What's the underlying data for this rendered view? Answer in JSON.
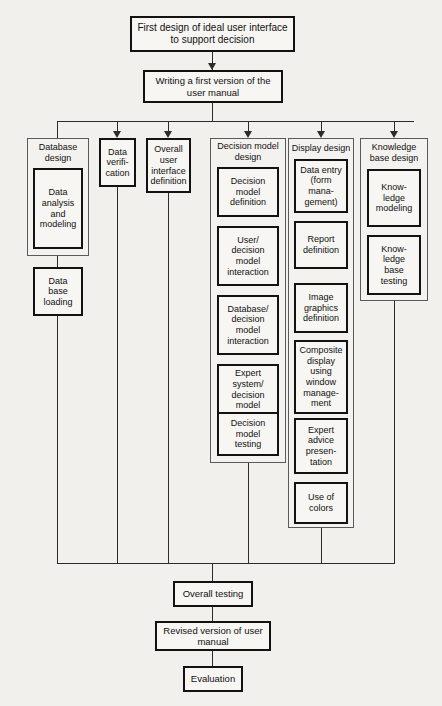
{
  "diagram": {
    "background_color": "#f2f0ec",
    "box_border_color": "#121212",
    "group_border_color": "#5a5a5a",
    "connector_color": "#2b2b2b"
  },
  "top": {
    "start": "First design of ideal user interface\nto support decision",
    "manual": "Writing a first version of the\nuser manual"
  },
  "columns": [
    {
      "id": "database-design",
      "title": "Database\ndesign",
      "grouped": true,
      "inner": [
        "Data\nanalysis\nand\nmodeling"
      ],
      "after": [
        "Data\nbase\nloading"
      ]
    },
    {
      "id": "data-verification",
      "title": "Data\nverifi-\ncation",
      "grouped": false,
      "inner": [],
      "after": []
    },
    {
      "id": "overall-user-interface-definition",
      "title": "Overall\nuser\ninterface\ndefinition",
      "grouped": false,
      "inner": [],
      "after": []
    },
    {
      "id": "decision-model-design",
      "title": "Decision model\ndesign",
      "grouped": true,
      "inner": [
        "Decision\nmodel\ndefinition",
        "User/\ndecision\nmodel\ninteraction",
        "Database/\ndecision\nmodel\ninteraction",
        "Expert\nsystem/\ndecision\nmodel\ninteraction",
        "Decision\nmodel\ntesting"
      ],
      "after": []
    },
    {
      "id": "display-design",
      "title": "Display design",
      "grouped": true,
      "inner": [
        "Data entry\n(form\nmana-\ngement)",
        "Report\ndefinition",
        "Image\ngraphics\ndefinition",
        "Composite\ndisplay\nusing\nwindow\nmanage-\nment",
        "Expert\nadvice\npresen-\ntation",
        "Use of\ncolors"
      ],
      "after": []
    },
    {
      "id": "knowledge-base-design",
      "title": "Knowledge\nbase design",
      "grouped": true,
      "inner": [
        "Know-\nledge\nmodeling",
        "Know-\nledge\nbase\ntesting"
      ],
      "after": []
    }
  ],
  "bottom": {
    "overall_testing": "Overall testing",
    "revised_manual": "Revised version of user\nmanual",
    "evaluation": "Evaluation"
  }
}
